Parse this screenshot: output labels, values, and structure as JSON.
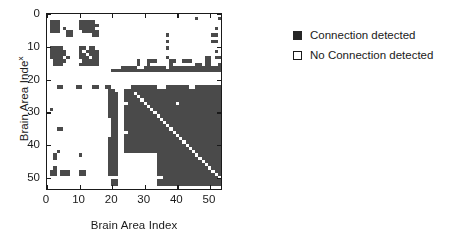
{
  "chart_data": {
    "type": "heatmap",
    "title": "",
    "xlabel": "Brain Area Index",
    "ylabel": "Brain Area Index",
    "ylabel_main": "Brain Area Inde",
    "ylabel_suffix": "x",
    "xlim": [
      0,
      54
    ],
    "ylim": [
      0,
      54
    ],
    "xticks": [
      0,
      10,
      20,
      30,
      40,
      50
    ],
    "yticks": [
      0,
      10,
      20,
      30,
      40,
      50
    ],
    "xticklabels": [
      "0",
      "10",
      "20",
      "30",
      "40",
      "50"
    ],
    "yticklabels": [
      "0",
      "10",
      "20",
      "30",
      "40",
      "50"
    ],
    "grid": false,
    "legend_position": "right",
    "n_rows": 54,
    "n_cols": 54,
    "value_labels": {
      "1": "Connection detected",
      "0": "No Connection detected"
    },
    "colors": {
      "connection": "#4a4a4a",
      "no_connection": "#ffffff",
      "axis": "#1a1a1a",
      "legend_marker": "#262626"
    },
    "legend": [
      {
        "marker": "filled-square",
        "label": "Connection detected",
        "value": 1
      },
      {
        "marker": "open-square",
        "label": "No Connection detected",
        "value": 0
      }
    ],
    "matrix": [
      "000000000000000000000000000000000000000000000000000000",
      "000000000000000000000000000000000000000000000010000001",
      "011100000011111000000000000000000000000000000000000000",
      "011100000011111100000000000000000000000000000000000000",
      "011101000011111000000000000000000000000000000000000010",
      "011100110001111100000000000000000000000000000000000000",
      "000000110000001100000000000000000000010000000000000110",
      "000000000000000000000000000000000000000000000000000000",
      "000000000000000000000000000000000000010000000000000110",
      "000000000000000000000000000000000000000000000000000000",
      "011110000011011000000000000000000000010000000000000000",
      "011111000010111100000000000000000000000000000000000010",
      "011111000011011100000000000000000000000000000000000000",
      "011110100011101100000000000000000000010000000000011011",
      "001111000001111100000000000010011100001100111000011000",
      "001110000011111100000000000010010000001000000011011001",
      "000000000000000000000001111100111111101111111111111111",
      "000000000000000000001111111111111111111111111111111111",
      "000000000000000000000000000000000000000000000000000000",
      "000000000000000000000000000000000000000000000000000000",
      "000000000000000000000000000000000000000000000000000000",
      "000000000000000000000000000000000000000000000000000000",
      "000110000110001100110000001111111100011111110011111111",
      "000000000000000000011000111111111111111111111111111111",
      "000000000000000000011100111011111111111111111111111111",
      "000000000000000000011100111101111111111111111111111111",
      "000000000000000000011100111110111111111111111111111111",
      "000000000000000000011100011111011111111101111111111111",
      "000000000000000000011100111111101111111111111111111111",
      "010000000000000000011100111111110111111111111111111111",
      "000000000000000000011100111111111011111111111111111111",
      "000000000000000000011100111111111101111111111111111111",
      "000000000000000000001100111111111110111111111111111111",
      "000000000000000000001100111111111111011111111111111111",
      "000000000000000000001100111111111111101111111111111111",
      "000110000000000000001100111111111111110111111111111111",
      "000000000000000000001100011111111111111011111111111111",
      "000000000000000000001100111111111111111101111111111111",
      "000000000000000000011100111111111111111110111111111111",
      "000000000000000000011100111111111111111111011111111111",
      "000000000000000000011100111111111111111111101111111111",
      "000000000000000000011100111111111111111111110111111111",
      "000100000000000000011100111111111111111111111011111111",
      "001000000010000000011100000000000011111111111101111111",
      "001000000000000000011100000000000011111111111110111111",
      "000000000000000000011100000000000011111111111111011111",
      "000000000000000000011100000000000011111111111111101111",
      "001000000000000000011100000000000011111111111111110111",
      "011011100011000000011100000000000011111111111111111011",
      "011011100011000000011100000000000011111111111111111101",
      "000000000000000000000000000000000000111111111111111110",
      "000000000000000000001100000000000011111111111111111111",
      "000000000000000000001100000000000011111111111111111111",
      "000000000000000000000000000000000000000000000000000000"
    ]
  }
}
